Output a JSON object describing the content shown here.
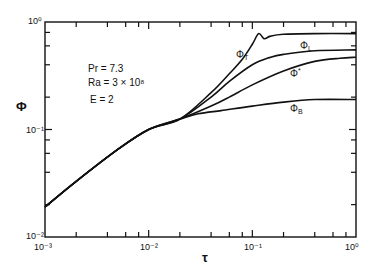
{
  "chart_data": {
    "type": "line",
    "title": "",
    "xlabel": "τ",
    "ylabel": "Φ",
    "xscale": "log",
    "yscale": "log",
    "xlim": [
      0.001,
      1
    ],
    "ylim": [
      0.01,
      1
    ],
    "grid": false,
    "x_tick_labels": [
      "10⁻³",
      "10⁻²",
      "10⁻¹",
      "10⁰"
    ],
    "y_tick_labels": [
      "10⁻²",
      "10⁻¹",
      "10⁰"
    ],
    "annotations": [
      "Pr = 7.3",
      "Ra = 3 × 10⁸",
      "E = 2"
    ],
    "series": [
      {
        "name": "ΦT",
        "label": "Φ",
        "sub": "T",
        "x": [
          0.001,
          0.002,
          0.005,
          0.01,
          0.02,
          0.04,
          0.06,
          0.08,
          0.1,
          0.115,
          0.13,
          0.15,
          0.2,
          0.4,
          1.0
        ],
        "y": [
          0.019,
          0.033,
          0.065,
          0.1,
          0.125,
          0.22,
          0.33,
          0.45,
          0.62,
          0.78,
          0.7,
          0.74,
          0.77,
          0.78,
          0.78
        ]
      },
      {
        "name": "ΦL",
        "label": "Φ",
        "sub": "L",
        "x": [
          0.001,
          0.002,
          0.005,
          0.01,
          0.02,
          0.04,
          0.06,
          0.1,
          0.15,
          0.2,
          0.4,
          1.0
        ],
        "y": [
          0.019,
          0.033,
          0.065,
          0.1,
          0.125,
          0.2,
          0.28,
          0.4,
          0.47,
          0.5,
          0.54,
          0.55
        ]
      },
      {
        "name": "Φ*",
        "label": "Φ",
        "sub": "*",
        "x": [
          0.001,
          0.002,
          0.005,
          0.01,
          0.02,
          0.04,
          0.06,
          0.1,
          0.2,
          0.4,
          0.7,
          1.0
        ],
        "y": [
          0.019,
          0.033,
          0.065,
          0.1,
          0.125,
          0.165,
          0.2,
          0.26,
          0.35,
          0.43,
          0.46,
          0.47
        ]
      },
      {
        "name": "ΦB",
        "label": "Φ",
        "sub": "B",
        "x": [
          0.001,
          0.002,
          0.005,
          0.01,
          0.02,
          0.03,
          0.05,
          0.1,
          0.2,
          0.4,
          1.0
        ],
        "y": [
          0.019,
          0.033,
          0.065,
          0.1,
          0.125,
          0.14,
          0.15,
          0.165,
          0.18,
          0.19,
          0.19
        ]
      }
    ]
  },
  "labels": {
    "ylabel": "Φ",
    "xlabel": "τ",
    "pr": "Pr  = 7.3",
    "ra": "Ra = 3 × 10⁸",
    "e": "E  = 2",
    "x_ticks": [
      "10⁻³",
      "10⁻²",
      "10⁻¹",
      "10⁰"
    ],
    "y_ticks": [
      "10⁻²",
      "10⁻¹",
      "10⁰"
    ],
    "phi_t": "ΦT",
    "phi_l": "ΦL",
    "phi_star": "Φ*",
    "phi_b": "ΦB"
  }
}
